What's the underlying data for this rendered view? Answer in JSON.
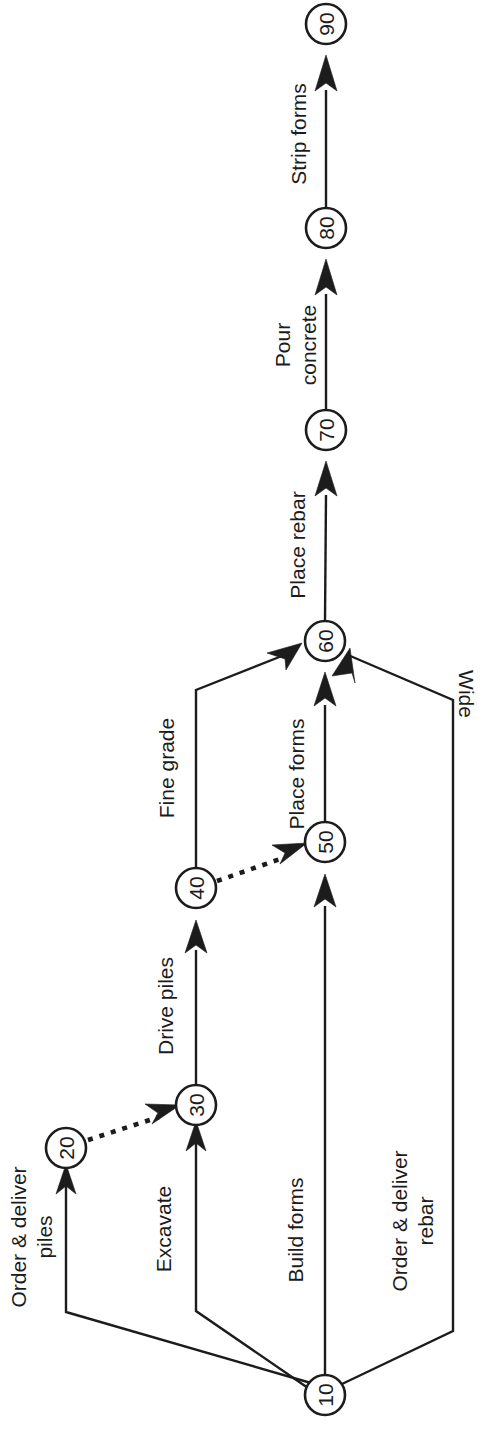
{
  "diagram": {
    "type": "activity-on-arrow-network",
    "orientation": "rotated-90-counterclockwise",
    "colors": {
      "stroke": "#1c1c1c",
      "node_fill": "#ffffff",
      "background": "#ffffff"
    },
    "nodes": [
      {
        "id": "n10",
        "label": "10",
        "x": 325,
        "y": 1395,
        "r": 20
      },
      {
        "id": "n20",
        "label": "20",
        "x": 66,
        "y": 1148,
        "r": 20
      },
      {
        "id": "n30",
        "label": "30",
        "x": 196,
        "y": 1105,
        "r": 20
      },
      {
        "id": "n40",
        "label": "40",
        "x": 196,
        "y": 888,
        "r": 20
      },
      {
        "id": "n50",
        "label": "50",
        "x": 325,
        "y": 842,
        "r": 20
      },
      {
        "id": "n60",
        "label": "60",
        "x": 325,
        "y": 641,
        "r": 20
      },
      {
        "id": "n70",
        "label": "70",
        "x": 326,
        "y": 430,
        "r": 20
      },
      {
        "id": "n80",
        "label": "80",
        "x": 326,
        "y": 228,
        "r": 20
      },
      {
        "id": "n90",
        "label": "90",
        "x": 326,
        "y": 24,
        "r": 20
      }
    ],
    "edges": [
      {
        "id": "e-order-piles",
        "from": "10",
        "to": "20",
        "label": "Order & deliver\npiles",
        "label_lines": [
          "Order & deliver",
          "piles"
        ],
        "style": "solid",
        "label_x": 30,
        "label_y": 1237
      },
      {
        "id": "e-excavate",
        "from": "10",
        "to": "30",
        "label": "Excavate",
        "label_lines": [
          "Excavate"
        ],
        "style": "solid",
        "label_x": 163,
        "label_y": 1229
      },
      {
        "id": "e-build-forms",
        "from": "10",
        "to": "50",
        "label": "Build forms",
        "label_lines": [
          "Build forms"
        ],
        "style": "solid",
        "label_x": 295,
        "label_y": 1230
      },
      {
        "id": "e-order-rebar",
        "from": "10",
        "to": "60",
        "label": "Order & deliver\nrebar",
        "label_lines": [
          "Order & deliver",
          "rebar"
        ],
        "style": "solid",
        "label_x": 411,
        "label_y": 1221
      },
      {
        "id": "e-dummy-20-30",
        "from": "20",
        "to": "30",
        "label": "",
        "label_lines": [],
        "style": "dashed",
        "label_x": 0,
        "label_y": 0
      },
      {
        "id": "e-drive-piles",
        "from": "30",
        "to": "40",
        "label": "Drive piles",
        "label_lines": [
          "Drive piles"
        ],
        "style": "solid",
        "label_x": 165,
        "label_y": 1006
      },
      {
        "id": "e-fine-grade",
        "from": "40",
        "to": "60",
        "label": "Fine grade",
        "label_lines": [
          "Fine grade"
        ],
        "style": "solid",
        "label_x": 166,
        "label_y": 768
      },
      {
        "id": "e-dummy-40-50",
        "from": "40",
        "to": "50",
        "label": "",
        "label_lines": [],
        "style": "dashed",
        "label_x": 0,
        "label_y": 0
      },
      {
        "id": "e-place-forms",
        "from": "50",
        "to": "60",
        "label": "Place forms",
        "label_lines": [
          "Place forms"
        ],
        "style": "solid",
        "label_x": 296,
        "label_y": 774
      },
      {
        "id": "e-wide",
        "from": "10",
        "to": "60",
        "label": "Wide",
        "label_lines": [
          "Wide"
        ],
        "style": "solid",
        "label_x": 466,
        "label_y": 694,
        "rotation": 90
      },
      {
        "id": "e-place-rebar",
        "from": "60",
        "to": "70",
        "label": "Place rebar",
        "label_lines": [
          "Place rebar"
        ],
        "style": "solid",
        "label_x": 297,
        "label_y": 545
      },
      {
        "id": "e-pour-concrete",
        "from": "70",
        "to": "80",
        "label": "Pour\nconcrete",
        "label_lines": [
          "Pour",
          "concrete"
        ],
        "style": "solid",
        "label_x": 295,
        "label_y": 345
      },
      {
        "id": "e-strip-forms",
        "from": "80",
        "to": "90",
        "label": "Strip forms",
        "label_lines": [
          "Strip forms"
        ],
        "style": "solid",
        "label_x": 298,
        "label_y": 134
      }
    ]
  }
}
